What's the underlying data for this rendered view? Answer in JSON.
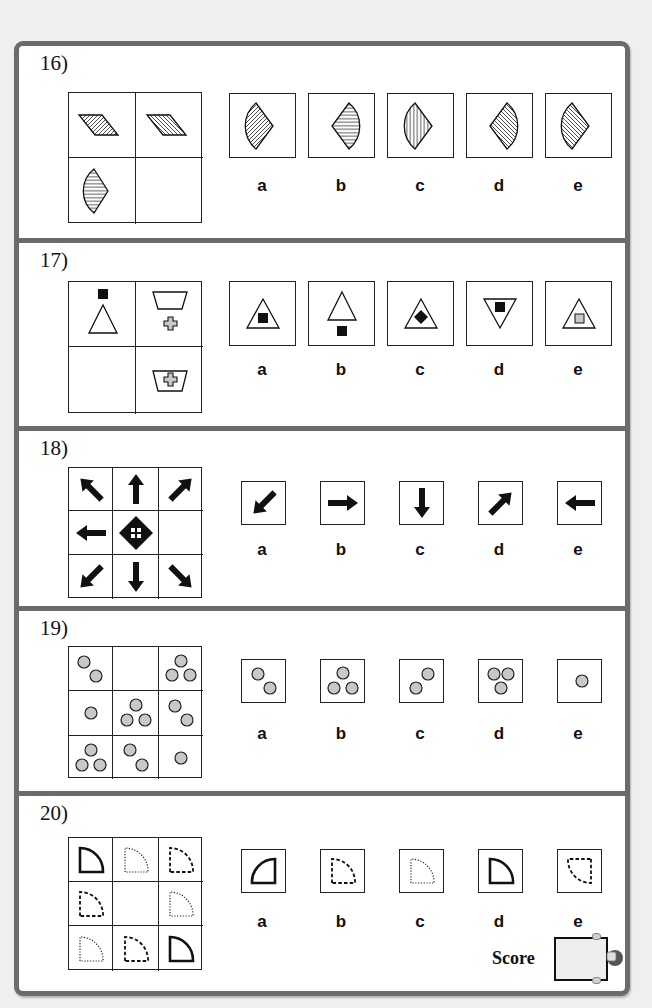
{
  "page": {
    "questions": [
      {
        "number": "16)",
        "grid_size": "2x2",
        "grid_cells": [
          "parallelogram, diagonal hatch (/)",
          "parallelogram, diagonal hatch (\\)",
          "sector (wedge) pointing right, horizontal hatch",
          "empty (missing)"
        ],
        "options": [
          {
            "label": "a",
            "figure": "sector pointing right, diagonal hatch (/)"
          },
          {
            "label": "b",
            "figure": "sector pointing left, horizontal hatch"
          },
          {
            "label": "c",
            "figure": "sector pointing right, vertical hatch"
          },
          {
            "label": "d",
            "figure": "sector pointing left, diagonal hatch (\\)"
          },
          {
            "label": "e",
            "figure": "sector pointing right, diagonal hatch (\\)"
          }
        ]
      },
      {
        "number": "17)",
        "grid_size": "2x2",
        "grid_cells": [
          "black square above triangle",
          "trapezoid above grey cross",
          "empty (missing)",
          "grey cross inside trapezoid"
        ],
        "options": [
          {
            "label": "a",
            "figure": "black square inside triangle"
          },
          {
            "label": "b",
            "figure": "black square below triangle"
          },
          {
            "label": "c",
            "figure": "black diamond inside triangle"
          },
          {
            "label": "d",
            "figure": "black square inside inverted triangle"
          },
          {
            "label": "e",
            "figure": "grey square inside triangle"
          }
        ]
      },
      {
        "number": "18)",
        "grid_size": "3x3",
        "grid_cells": [
          "arrow up-left",
          "arrow up",
          "arrow up-right",
          "arrow left",
          "diamond with four dots",
          "empty (missing)",
          "arrow down-left",
          "arrow down",
          "arrow down-right"
        ],
        "options": [
          {
            "label": "a",
            "figure": "arrow down-left"
          },
          {
            "label": "b",
            "figure": "arrow right"
          },
          {
            "label": "c",
            "figure": "arrow down"
          },
          {
            "label": "d",
            "figure": "arrow up-right"
          },
          {
            "label": "e",
            "figure": "arrow left"
          }
        ]
      },
      {
        "number": "19)",
        "grid_size": "3x3",
        "grid_cells": [
          "2 circles diagonal",
          "empty (missing)",
          "3 circles triangle",
          "1 circle",
          "3 circles triangle",
          "2 circles diagonal",
          "3 circles triangle",
          "2 circles diagonal",
          "1 circle"
        ],
        "options": [
          {
            "label": "a",
            "figure": "2 circles diagonal (top-left to bottom-right)"
          },
          {
            "label": "b",
            "figure": "3 circles triangle (point up)"
          },
          {
            "label": "c",
            "figure": "2 circles diagonal (top-right to bottom-left)"
          },
          {
            "label": "d",
            "figure": "3 circles triangle (point down)"
          },
          {
            "label": "e",
            "figure": "1 circle"
          }
        ]
      },
      {
        "number": "20)",
        "grid_size": "3x3",
        "grid_cells": [
          "quarter circle, thick solid",
          "quarter circle, dotted",
          "quarter circle, dashed",
          "quarter circle, dashed",
          "empty (missing)",
          "quarter circle, dotted",
          "quarter circle, dotted",
          "quarter circle, dashed",
          "quarter circle, thick solid"
        ],
        "options": [
          {
            "label": "a",
            "figure": "quarter circle mirrored, thick solid"
          },
          {
            "label": "b",
            "figure": "quarter circle, dashed"
          },
          {
            "label": "c",
            "figure": "quarter circle, dotted"
          },
          {
            "label": "d",
            "figure": "quarter circle, thick solid"
          },
          {
            "label": "e",
            "figure": "quarter circle rotated, dashed"
          }
        ]
      }
    ],
    "score": {
      "label": "Score",
      "value": ""
    }
  },
  "colors": {
    "frame": "#6b6b6b",
    "circle_fill": "#c8c8c8",
    "cross_fill": "#c8c8c8",
    "ink": "#111111",
    "score_box": "#eeeeee"
  }
}
